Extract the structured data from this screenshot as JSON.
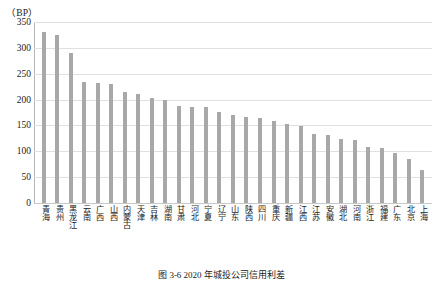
{
  "unit_label": "（BP）",
  "caption": "图 3-6   2020 年城投公司信用利差",
  "style": {
    "bar_color": "#a8a8a8",
    "gridline_color": "#e0e0e0",
    "axis_color": "#b5b5b5",
    "text_color": "#1a1a1a",
    "background": "#ffffff"
  },
  "chart_data": {
    "type": "bar",
    "title": "图 3-6   2020 年城投公司信用利差",
    "xlabel": "",
    "ylabel": "（BP）",
    "ylim": [
      0,
      350
    ],
    "ytick_step": 50,
    "yticks": [
      350,
      300,
      250,
      200,
      150,
      100,
      50,
      0
    ],
    "grid": true,
    "legend": "none",
    "categories": [
      "青海",
      "贵州",
      "黑龙江",
      "云南",
      "广西",
      "山西",
      "内蒙古",
      "天津",
      "吉林",
      "湖南",
      "甘肃",
      "河北",
      "宁夏",
      "辽宁",
      "山东",
      "陕西",
      "四川",
      "重庆",
      "新疆",
      "江西",
      "江苏",
      "安徽",
      "湖北",
      "河南",
      "浙江",
      "福建",
      "广东",
      "北京",
      "上海"
    ],
    "values": [
      331,
      325,
      290,
      234,
      233,
      231,
      214,
      211,
      204,
      199,
      188,
      186,
      185,
      176,
      170,
      167,
      165,
      159,
      152,
      149,
      134,
      132,
      124,
      122,
      109,
      106,
      97,
      86,
      63
    ],
    "series_name": "信用利差"
  }
}
